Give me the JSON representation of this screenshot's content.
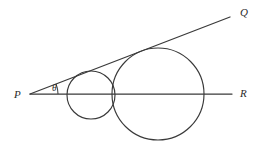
{
  "figure": {
    "kind": "geometry-diagram",
    "background_color": "#ffffff",
    "stroke_color": "#3a3a3a",
    "label_color": "#2b2b2b",
    "canvas": {
      "width": 262,
      "height": 155
    }
  },
  "labels": {
    "vertex_p": "P",
    "ray_q": "Q",
    "ray_r": "R",
    "angle_theta": "θ"
  },
  "geometry": {
    "vertex": {
      "name": "P",
      "x": 30,
      "y": 94
    },
    "rays": [
      {
        "name": "PQ",
        "from_x": 30,
        "from_y": 94,
        "to_x": 230,
        "to_y": 17
      },
      {
        "name": "PR",
        "from_x": 30,
        "from_y": 94,
        "to_x": 232,
        "to_y": 94
      }
    ],
    "circles": [
      {
        "name": "small-circle",
        "cx": 91,
        "cy": 95,
        "r": 24
      },
      {
        "name": "large-circle",
        "cx": 158,
        "cy": 94,
        "r": 46
      }
    ],
    "angle_arc": {
      "cx": 30,
      "cy": 94,
      "r": 28,
      "start_deg": 0,
      "sweep_deg": -21
    }
  },
  "label_positions": {
    "vertex_p": {
      "x": 14,
      "y": 98
    },
    "ray_q": {
      "x": 240,
      "y": 16
    },
    "ray_r": {
      "x": 240,
      "y": 97
    },
    "angle_theta": {
      "x": 52,
      "y": 91
    }
  }
}
